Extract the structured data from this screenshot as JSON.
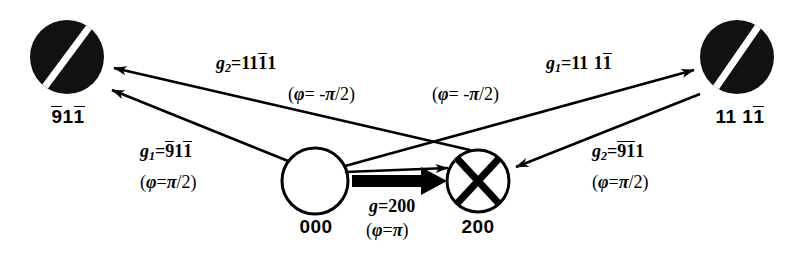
{
  "figure": {
    "kind": "electron-diffraction-contrast-schematic",
    "background": "#ffffff",
    "ink": "#000000"
  },
  "nodes": [
    {
      "id": "node-left",
      "caption": "9̅11̅",
      "caption_digits": [
        {
          "d": "9",
          "bar": true
        },
        {
          "d": "1",
          "bar": false
        },
        {
          "d": "1",
          "bar": true
        }
      ],
      "style": "filled-black-disc-with-white-stripe",
      "cx": 67,
      "cy": 57,
      "r": 37
    },
    {
      "id": "node-right",
      "caption": "11 11̅",
      "caption_digits": [
        {
          "d": "1",
          "bar": false
        },
        {
          "d": "1",
          "bar": false
        },
        {
          "d": " ",
          "bar": false
        },
        {
          "d": "1",
          "bar": false
        },
        {
          "d": "1",
          "bar": true
        }
      ],
      "style": "filled-black-disc-with-white-stripe",
      "cx": 737,
      "cy": 57,
      "r": 37
    },
    {
      "id": "node-000",
      "caption": "000",
      "style": "open-white-circle",
      "cx": 315,
      "cy": 181,
      "r": 33
    },
    {
      "id": "node-200",
      "caption": "200",
      "style": "white-circle-with-black-cross",
      "cx": 478,
      "cy": 181,
      "r": 31
    }
  ],
  "labels": {
    "g2_upper_left": {
      "g": "g",
      "sub": "2",
      "eq": "=",
      "digits": [
        {
          "d": "1",
          "bar": false
        },
        {
          "d": "1",
          "bar": false
        },
        {
          "d": "1",
          "bar": true
        },
        {
          "d": "1",
          "bar": false
        }
      ],
      "phase": "(φ= -π/2)",
      "phase_parts": {
        "open": "(",
        "phi": "φ",
        "eq": "= -",
        "pi": "π",
        "tail": "/2)"
      }
    },
    "g1_upper_right": {
      "g": "g",
      "sub": "1",
      "eq": "=",
      "digits": [
        {
          "d": "1",
          "bar": false
        },
        {
          "d": "1",
          "bar": false
        },
        {
          "d": " ",
          "bar": false
        },
        {
          "d": "1",
          "bar": false
        },
        {
          "d": "1",
          "bar": true
        }
      ],
      "phase": "(φ= -π/2)",
      "phase_parts": {
        "open": "(",
        "phi": "φ",
        "eq": "= -",
        "pi": "π",
        "tail": "/2)"
      }
    },
    "g1_lower_left": {
      "g": "g",
      "sub": "1",
      "eq": "=",
      "digits": [
        {
          "d": "9",
          "bar": true
        },
        {
          "d": "1",
          "bar": false
        },
        {
          "d": "1",
          "bar": true
        }
      ],
      "phase": "(φ=π/2)",
      "phase_parts": {
        "open": "(",
        "phi": "φ",
        "eq": "=",
        "pi": "π",
        "tail": "/2)"
      }
    },
    "g2_lower_right": {
      "g": "g",
      "sub": "2",
      "eq": "=",
      "digits": [
        {
          "d": "9",
          "bar": true
        },
        {
          "d": "1",
          "bar": true
        },
        {
          "d": "1",
          "bar": false
        }
      ],
      "phase": "(φ=π/2)",
      "phase_parts": {
        "open": "(",
        "phi": "φ",
        "eq": "=",
        "pi": "π",
        "tail": "/2)"
      }
    },
    "g_center": {
      "g": "g",
      "sub": "",
      "eq": "=",
      "digits": [
        {
          "d": "2",
          "bar": false
        },
        {
          "d": "0",
          "bar": false
        },
        {
          "d": "0",
          "bar": false
        }
      ],
      "phase": "(φ=π)",
      "phase_parts": {
        "open": "(",
        "phi": "φ",
        "eq": "=",
        "pi": "π",
        "tail": ")"
      }
    }
  },
  "arrows": [
    {
      "id": "arrow-200-to-left",
      "from": "node-200",
      "to": "node-left",
      "label": "g2_upper_left"
    },
    {
      "id": "arrow-000-to-left",
      "from": "node-000",
      "to": "node-left",
      "label": "g1_lower_left"
    },
    {
      "id": "arrow-000-to-200",
      "from": "node-000",
      "to": "node-200",
      "label": "g_center",
      "style": "thick-block-arrow"
    },
    {
      "id": "arrow-000-to-right",
      "from": "node-000",
      "to": "node-right",
      "label": "g1_upper_right"
    },
    {
      "id": "arrow-right-to-200",
      "from": "node-right",
      "to": "node-200",
      "label": "g2_lower_right"
    }
  ]
}
